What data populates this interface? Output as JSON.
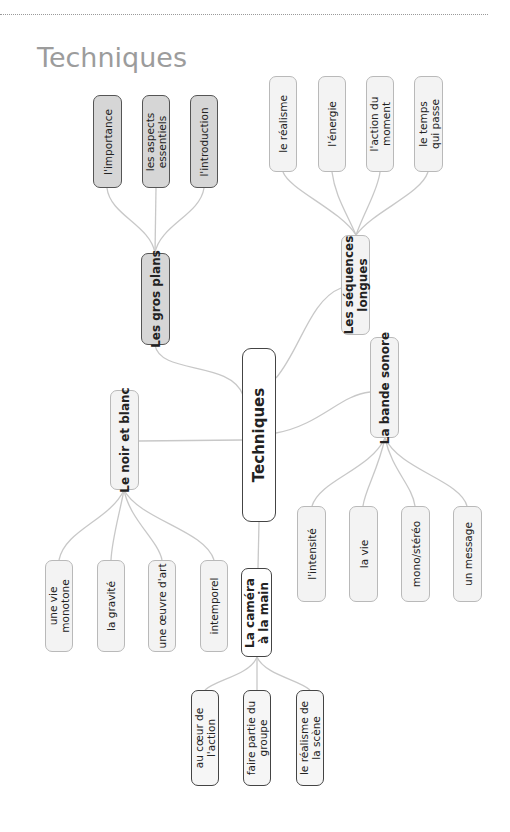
{
  "page": {
    "title": "Techniques"
  },
  "central": {
    "label": "Techniques"
  },
  "branches": {
    "gros_plans": {
      "label": "Les gros plans",
      "children": [
        "l'importance",
        "les aspects\nessentiels",
        "l'introduction"
      ]
    },
    "sequences": {
      "label": "Les séquences\nlongues",
      "children": [
        "le réalisme",
        "l'énergie",
        "l'action du\nmoment",
        "le temps\nqui passe"
      ]
    },
    "bande_sonore": {
      "label": "La bande sonore",
      "children": [
        "l'intensité",
        "la vie",
        "mono/stéréo",
        "un message"
      ]
    },
    "noir_blanc": {
      "label": "Le noir et blanc",
      "children": [
        "une vie\nmonotone",
        "la gravité",
        "une œuvre d'art",
        "intemporel"
      ]
    },
    "camera": {
      "label": "La caméra\nà la main",
      "children": [
        "au cœur de\nl'action",
        "faire partie du\ngroupe",
        "le réalisme de\nla scène"
      ]
    }
  },
  "colors": {
    "title": "#9c9c9c",
    "link": "#c8c8c8",
    "dark_node_fill": "#d6d6d6",
    "light_node_fill": "#f3f3f3",
    "dark_border": "#444444",
    "light_border": "#b9b9b9"
  }
}
